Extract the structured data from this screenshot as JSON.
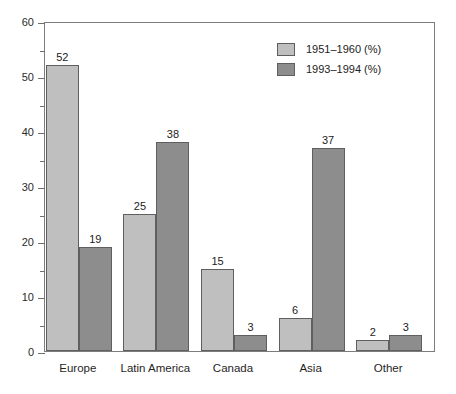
{
  "chart_data": {
    "type": "bar",
    "title": "",
    "subtitle": "",
    "xlabel": "",
    "ylabel": "",
    "ylim": [
      0,
      60
    ],
    "ytick_step": 10,
    "yminor_step": 5,
    "ytick_labels": [
      "0",
      "10",
      "20",
      "30",
      "40",
      "50",
      "60"
    ],
    "grid": false,
    "legend_position": "top-right-inside",
    "categories": [
      "Europe",
      "Latin America",
      "Canada",
      "Asia",
      "Other"
    ],
    "series": [
      {
        "name": "1951–1960 (%)",
        "color": "#bfbfbf",
        "values": [
          52,
          25,
          15,
          6,
          2
        ]
      },
      {
        "name": "1993–1994 (%)",
        "color": "#8d8d8d",
        "values": [
          19,
          38,
          3,
          37,
          3
        ]
      }
    ]
  },
  "axis": {
    "frame_color": "#7d7d7d",
    "tick_color": "#6f6f6f"
  },
  "canvas": {
    "background": "#ffffff"
  }
}
